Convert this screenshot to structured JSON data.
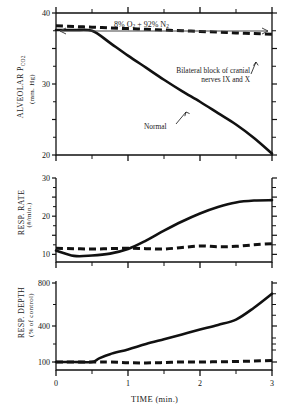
{
  "figure": {
    "gas_annotation": "8% O2 + 92% N2",
    "gas_annotation_parts": {
      "pre": "8% O",
      "sub1": "2",
      "mid": " + 92% N",
      "sub2": "2"
    },
    "xaxis_title": "TIME (min.)",
    "series_labels": {
      "normal": "Normal",
      "blocked_line1": "Bilateral block of cranial",
      "blocked_line2": "nerves IX and X"
    }
  },
  "panels": [
    {
      "id": "alveolar-pco2",
      "ylabel_main": "ALVEOLAR P",
      "ylabel_sub": "CO2",
      "ylabel_units": "(mm. Hg)",
      "ytick_labels": [
        "40",
        "30",
        "20"
      ]
    },
    {
      "id": "resp-rate",
      "ylabel_main": "RESP. RATE",
      "ylabel_units": "(#/min.)",
      "ytick_labels": [
        "30",
        "20",
        "10"
      ]
    },
    {
      "id": "resp-depth",
      "ylabel_main": "RESP. DEPTH",
      "ylabel_units": "(% of control)",
      "ytick_labels": [
        "800",
        "400",
        "100"
      ]
    }
  ],
  "xtick_labels": [
    "0",
    "1",
    "2",
    "3"
  ],
  "chart_data": [
    {
      "type": "line",
      "title": "Alveolar PCO2 during hypoxia",
      "xlabel": "TIME (min.)",
      "ylabel": "ALVEOLAR PCO2 (mm. Hg)",
      "xlim": [
        0,
        3
      ],
      "ylim": [
        20,
        40
      ],
      "yticks": [
        20,
        25,
        30,
        35,
        40
      ],
      "ytick_labels": [
        "20",
        "",
        "30",
        "",
        "40"
      ],
      "xticks": [
        0,
        0.5,
        1,
        1.5,
        2,
        2.5,
        3
      ],
      "xtick_labels": [
        "0",
        "",
        "1",
        "",
        "2",
        "",
        "3"
      ],
      "grid": false,
      "legend": "inline-annotation",
      "series": [
        {
          "name": "Normal",
          "style": "solid",
          "x": [
            0,
            0.25,
            0.5,
            0.75,
            1.0,
            1.25,
            1.5,
            1.75,
            2.0,
            2.25,
            2.5,
            2.75,
            3.0
          ],
          "values": [
            37.6,
            37.6,
            37.5,
            35.8,
            34.0,
            32.3,
            30.6,
            29.0,
            27.5,
            25.9,
            24.3,
            22.4,
            20.2
          ]
        },
        {
          "name": "Bilateral block of cranial nerves IX and X",
          "style": "dashed",
          "x": [
            0,
            0.25,
            0.5,
            0.75,
            1.0,
            1.25,
            1.5,
            1.75,
            2.0,
            2.25,
            2.5,
            2.75,
            3.0
          ],
          "values": [
            38.2,
            38.1,
            38.0,
            37.9,
            37.8,
            37.7,
            37.6,
            37.5,
            37.4,
            37.3,
            37.2,
            37.1,
            37.0
          ]
        }
      ]
    },
    {
      "type": "line",
      "title": "Respiratory rate during hypoxia",
      "xlabel": "TIME (min.)",
      "ylabel": "RESP. RATE (#/min.)",
      "xlim": [
        0,
        3
      ],
      "ylim": [
        8,
        30
      ],
      "yticks": [
        10,
        15,
        20,
        25,
        30
      ],
      "ytick_labels": [
        "10",
        "",
        "20",
        "",
        "30"
      ],
      "xticks": [
        0,
        0.5,
        1,
        1.5,
        2,
        2.5,
        3
      ],
      "xtick_labels": [
        "0",
        "",
        "1",
        "",
        "2",
        "",
        "3"
      ],
      "grid": false,
      "series": [
        {
          "name": "Normal",
          "style": "solid",
          "x": [
            0,
            0.25,
            0.5,
            0.75,
            1.0,
            1.25,
            1.5,
            1.75,
            2.0,
            2.25,
            2.5,
            2.75,
            3.0
          ],
          "values": [
            11.0,
            9.6,
            9.7,
            10.2,
            11.4,
            13.6,
            16.2,
            18.6,
            20.7,
            22.4,
            23.6,
            24.1,
            24.2
          ]
        },
        {
          "name": "Bilateral block of cranial nerves IX and X",
          "style": "dashed",
          "x": [
            0,
            0.25,
            0.5,
            0.75,
            1.0,
            1.25,
            1.5,
            1.75,
            2.0,
            2.25,
            2.5,
            2.75,
            3.0
          ],
          "values": [
            11.6,
            11.5,
            11.4,
            11.5,
            11.6,
            11.5,
            11.4,
            11.8,
            12.2,
            12.0,
            12.1,
            12.5,
            12.8
          ]
        }
      ]
    },
    {
      "type": "line",
      "title": "Respiratory depth during hypoxia",
      "xlabel": "TIME (min.)",
      "ylabel": "RESP. DEPTH (% of control)",
      "xlim": [
        0,
        3
      ],
      "ylim": [
        80,
        800
      ],
      "yticks": [
        100,
        400,
        800
      ],
      "ytick_labels": [
        "100",
        "400",
        "800"
      ],
      "xticks": [
        0,
        0.5,
        1,
        1.5,
        2,
        2.5,
        3
      ],
      "xtick_labels": [
        "0",
        "",
        "1",
        "",
        "2",
        "",
        "3"
      ],
      "grid": false,
      "series": [
        {
          "name": "Normal",
          "style": "solid",
          "x": [
            0,
            0.25,
            0.5,
            0.6,
            0.75,
            1.0,
            1.25,
            1.5,
            1.75,
            2.0,
            2.25,
            2.5,
            2.75,
            3.0
          ],
          "values": [
            100,
            100,
            100,
            130,
            165,
            205,
            250,
            290,
            330,
            370,
            410,
            460,
            570,
            700
          ]
        },
        {
          "name": "Bilateral block of cranial nerves IX and X",
          "style": "dashed",
          "x": [
            0,
            0.5,
            0.75,
            1.0,
            1.25,
            1.5,
            1.75,
            2.0,
            2.25,
            2.5,
            2.75,
            3.0
          ],
          "values": [
            100,
            100,
            100,
            96,
            95,
            97,
            100,
            100,
            102,
            104,
            108,
            112
          ]
        }
      ]
    }
  ]
}
